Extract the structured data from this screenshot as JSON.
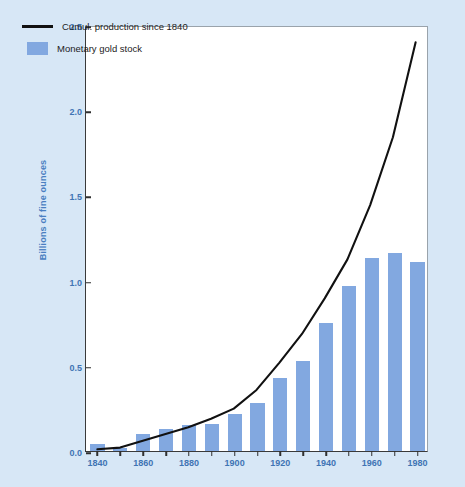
{
  "figure": {
    "background_color": "#d7e7f6",
    "plot_background": "#ffffff",
    "label_color": "#3f74b4",
    "bar_color": "#82a8e0",
    "line_color": "#111111"
  },
  "axes": {
    "ylabel": "Billions of fine ounces",
    "yticks": [
      "0.0",
      "0.5",
      "1.0",
      "1.5",
      "2.0",
      "2.5"
    ],
    "xticks": [
      "1840",
      "1860",
      "1880",
      "1900",
      "1920",
      "1940",
      "1960",
      "1980"
    ]
  },
  "legend": {
    "items": [
      {
        "label": "Cumul. production since 1840",
        "marker": "line"
      },
      {
        "label": "Monetary gold stock",
        "marker": "swatch"
      }
    ]
  },
  "caption": {
    "text": ""
  },
  "chart_data": {
    "type": "bar",
    "title": "",
    "xlabel": "",
    "ylabel": "Billions of fine ounces",
    "xlim": [
      1835,
      1985
    ],
    "ylim": [
      0.0,
      2.5
    ],
    "grid": false,
    "legend_position": "top-left",
    "categories": [
      1840,
      1850,
      1860,
      1870,
      1880,
      1890,
      1900,
      1910,
      1920,
      1930,
      1940,
      1950,
      1960,
      1970,
      1980
    ],
    "series": [
      {
        "name": "Monetary gold stock",
        "type": "bar",
        "color": "#82a8e0",
        "values": [
          0.04,
          0.02,
          0.1,
          0.13,
          0.15,
          0.16,
          0.22,
          0.28,
          0.43,
          0.53,
          0.75,
          0.97,
          1.13,
          1.16,
          1.11
        ]
      },
      {
        "name": "Cumul. production since 1840",
        "type": "line",
        "color": "#111111",
        "values": [
          0.01,
          0.02,
          0.06,
          0.1,
          0.14,
          0.19,
          0.25,
          0.36,
          0.52,
          0.69,
          0.9,
          1.13,
          1.45,
          1.85,
          2.41
        ]
      }
    ]
  }
}
